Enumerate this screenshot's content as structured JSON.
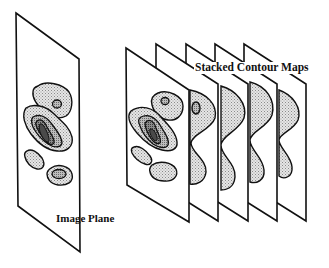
{
  "diagram": {
    "labels": {
      "stacked_contour_maps": "Stacked Contour Maps",
      "image_plane": "Image Plane"
    },
    "colors": {
      "stroke": "#111111",
      "plane_fill": "#ffffff",
      "light_shade": "#d4d4d4",
      "mid_shade": "#a8a8a8",
      "dark_shade": "#6e6e6e",
      "darkest_shade": "#4a4a4a"
    },
    "elements": {
      "image_plane": "single plane with nested contour regions",
      "stacked_planes_count": 5,
      "stacked_planes": [
        "contour map level 1 (full contours)",
        "contour map level 2 (two lobes with small island)",
        "contour map level 3 (two lobes)",
        "contour map level 4 (two lobes)",
        "contour map level 5 (two lobes)"
      ]
    }
  }
}
